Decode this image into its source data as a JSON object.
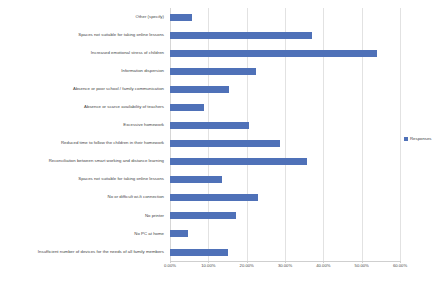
{
  "chart_data": {
    "type": "bar",
    "orientation": "horizontal",
    "title": "",
    "xlabel": "",
    "ylabel": "",
    "xlim": [
      0,
      60
    ],
    "xtick_labels": [
      "0.00%",
      "10.00%",
      "20.00%",
      "30.00%",
      "40.00%",
      "50.00%",
      "60.00%"
    ],
    "xtick_values": [
      0,
      10,
      20,
      30,
      40,
      50,
      60
    ],
    "grid": true,
    "legend_position": "right",
    "series": [
      {
        "name": "Responses",
        "color": "#4f71b8",
        "values": [
          5.8,
          37.0,
          54.0,
          22.5,
          15.5,
          8.8,
          20.5,
          28.8,
          35.8,
          13.5,
          23.0,
          17.2,
          4.8,
          15.0
        ]
      }
    ],
    "categories": [
      "Other (specify)",
      "Spaces not suitable for taking online lessons",
      "Increased emotional stress of children",
      "Information dispersion",
      "Absence or poor school / family communication",
      "Absence or scarce availability of teachers",
      "Excessive homework",
      "Reduced time to follow the children in their homework",
      "Reconciliation between smart working and distance learning",
      "Spaces not suitable for taking online lessons",
      "No or difficult wi-fi connection",
      "No printer",
      "No PC at home",
      "Insufficient number of devices for the needs of all family members"
    ]
  },
  "legend": {
    "entries": [
      {
        "label": "Responses",
        "color": "#4f71b8"
      }
    ]
  },
  "colors": {
    "bar": "#4f71b8",
    "gridline": "#e2e2e2",
    "axis": "#cfcfcf",
    "text": "#3f3f3f",
    "background": "#ffffff"
  }
}
